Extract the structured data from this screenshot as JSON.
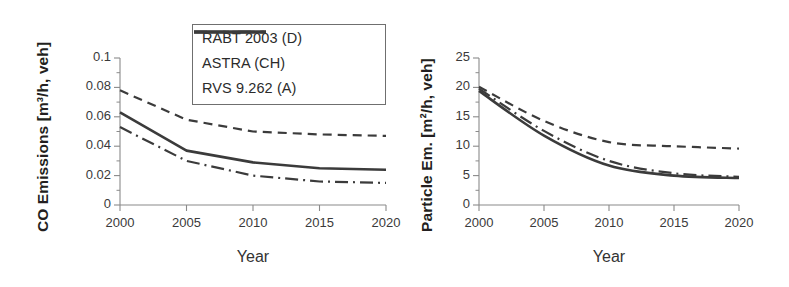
{
  "figure": {
    "panels": [
      "co",
      "particle"
    ]
  },
  "legend": {
    "items": [
      {
        "label": "RABT 2003 (D)",
        "style": "solid",
        "key": "rabt"
      },
      {
        "label": "ASTRA (CH)",
        "style": "dashdot",
        "key": "astra"
      },
      {
        "label": "RVS 9.262 (A)",
        "style": "dashed",
        "key": "rvs"
      }
    ],
    "border_color": "#6f6f6f"
  },
  "chart_data": [
    {
      "id": "co",
      "type": "line",
      "title": "",
      "xlabel": "Year",
      "ylabel": "CO Emissions [m³/h, veh]",
      "x": [
        2000,
        2005,
        2010,
        2015,
        2020
      ],
      "xlim": [
        2000,
        2020
      ],
      "ylim": [
        0,
        0.1
      ],
      "xticks": [
        2000,
        2005,
        2010,
        2015,
        2020
      ],
      "xticklabels": [
        "2000",
        "2005",
        "2010",
        "2015",
        "2020"
      ],
      "yticks": [
        0,
        0.02,
        0.04,
        0.06,
        0.08,
        0.1
      ],
      "yticklabels": [
        "0",
        "0.02",
        "0.04",
        "0.06",
        "0.08",
        "0.1"
      ],
      "minor_yticks": [
        0.01,
        0.03,
        0.05,
        0.07,
        0.09
      ],
      "grid": false,
      "legend_position": "upper-right-inside",
      "series": [
        {
          "name": "RABT 2003 (D)",
          "style": "solid",
          "color": "#3b3b3b",
          "values": [
            0.063,
            0.037,
            0.029,
            0.025,
            0.024
          ]
        },
        {
          "name": "ASTRA (CH)",
          "style": "dashdot",
          "color": "#3b3b3b",
          "values": [
            0.053,
            0.03,
            0.02,
            0.016,
            0.015
          ]
        },
        {
          "name": "RVS 9.262 (A)",
          "style": "dashed",
          "color": "#3b3b3b",
          "values": [
            0.078,
            0.058,
            0.05,
            0.048,
            0.047
          ]
        }
      ]
    },
    {
      "id": "particle",
      "type": "line",
      "title": "",
      "xlabel": "Year",
      "ylabel": "Particle Em. [m²/h, veh]",
      "x": [
        2000,
        2005,
        2010,
        2015,
        2020
      ],
      "xlim": [
        2000,
        2020
      ],
      "ylim": [
        0,
        25
      ],
      "xticks": [
        2000,
        2005,
        2010,
        2015,
        2020
      ],
      "xticklabels": [
        "2000",
        "2005",
        "2010",
        "2015",
        "2020"
      ],
      "yticks": [
        0,
        5,
        10,
        15,
        20,
        25
      ],
      "yticklabels": [
        "0",
        "5",
        "10",
        "15",
        "20",
        "25"
      ],
      "minor_yticks": [
        2.5,
        7.5,
        12.5,
        17.5,
        22.5
      ],
      "grid": false,
      "legend_position": "none",
      "series": [
        {
          "name": "RABT 2003 (D)",
          "style": "solid",
          "color": "#3b3b3b",
          "values": [
            19.4,
            11.8,
            6.7,
            5.0,
            4.6
          ]
        },
        {
          "name": "ASTRA (CH)",
          "style": "dashdot",
          "color": "#3b3b3b",
          "values": [
            19.8,
            12.6,
            7.5,
            5.4,
            4.8
          ]
        },
        {
          "name": "RVS 9.262 (A)",
          "style": "dashed",
          "color": "#3b3b3b",
          "values": [
            20.1,
            14.3,
            10.7,
            10.0,
            9.6
          ]
        }
      ]
    }
  ]
}
